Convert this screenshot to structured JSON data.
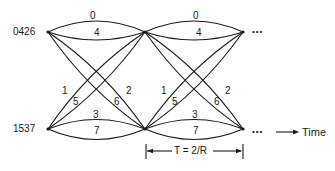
{
  "states": {
    "top": "0426",
    "bottom": "1537"
  },
  "sections": [
    {
      "edges": {
        "top_upper": "0",
        "top_lower": "4",
        "bottom_upper": "3",
        "bottom_lower": "7",
        "diag_up_outer": "1",
        "diag_up_inner": "5",
        "diag_down_outer": "2",
        "diag_down_inner": "6"
      }
    },
    {
      "edges": {
        "top_upper": "0",
        "top_lower": "4",
        "bottom_upper": "3",
        "bottom_lower": "7",
        "diag_up_outer": "1",
        "diag_up_inner": "5",
        "diag_down_outer": "2",
        "diag_down_inner": "6"
      }
    }
  ],
  "continuation": {
    "top": "•••",
    "bottom": "•••"
  },
  "time_axis": {
    "label": "Time"
  },
  "period": {
    "label": "T = 2/R"
  },
  "colors": {
    "line": "#1a1a1a",
    "background": "#ffffff"
  }
}
